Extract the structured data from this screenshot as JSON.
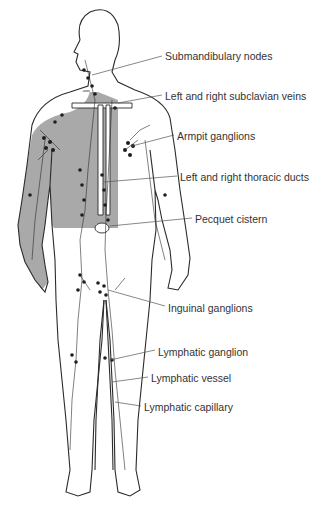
{
  "diagram": {
    "colors": {
      "background": "#ffffff",
      "outline": "#2b2b2b",
      "shaded_region": "#a9a9a9",
      "node": "#1e1e1e",
      "label_text": "#333333",
      "leader_line": "#555555"
    },
    "labels": [
      {
        "text": "Submandibulary nodes",
        "x": 165,
        "y": 50
      },
      {
        "text": "Left and right subclavian veins",
        "x": 165,
        "y": 90
      },
      {
        "text": "Armpit ganglions",
        "x": 177,
        "y": 130
      },
      {
        "text": "Left and right thoracic ducts",
        "x": 180,
        "y": 171
      },
      {
        "text": "Pecquet cistern",
        "x": 195,
        "y": 213
      },
      {
        "text": "Inguinal ganglions",
        "x": 168,
        "y": 302
      },
      {
        "text": "Lymphatic ganglion",
        "x": 158,
        "y": 346
      },
      {
        "text": "Lymphatic vessel",
        "x": 151,
        "y": 372
      },
      {
        "text": "Lymphatic capillary",
        "x": 144,
        "y": 401
      }
    ]
  }
}
